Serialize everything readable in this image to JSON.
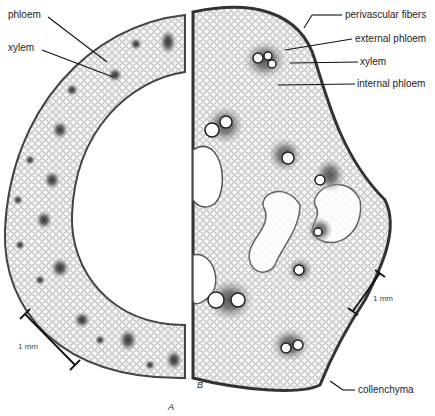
{
  "figure": {
    "panel_a": {
      "letter": "A",
      "labels": {
        "phloem": "phloem",
        "xylem": "xylem"
      },
      "scale_bar": "1 mm"
    },
    "panel_b": {
      "letter": "B",
      "labels": {
        "perivascular": "perivascular fibers",
        "external_phloem": "external phloem",
        "xylem": "xylem",
        "internal_phloem": "internal phloem",
        "collenchyma": "collenchyma"
      },
      "scale_bar": "1 mm"
    },
    "colors": {
      "tissue": "#d8d8d8",
      "cell_wall": "#777777",
      "bundle": "#555555",
      "epidermis": "#333333"
    }
  }
}
